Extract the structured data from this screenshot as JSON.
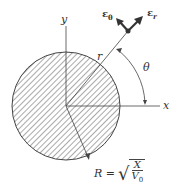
{
  "diagram": {
    "labels": {
      "y_axis": "y",
      "x_axis": "x",
      "radius_vector": "r",
      "angle": "θ",
      "unit_theta": "ε",
      "unit_theta_sub": "θ",
      "unit_r": "ε",
      "unit_r_sub": "r",
      "radius_eq_lhs": "R =",
      "radius_eq_num": "X",
      "radius_eq_den": "V",
      "radius_eq_den_sub": "0"
    },
    "colors": {
      "line": "#444444",
      "hatch": "#555555"
    }
  }
}
